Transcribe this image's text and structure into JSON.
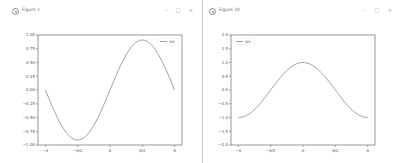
{
  "windows": [
    {
      "title": "Figure 1",
      "controls": {
        "minimize": "–",
        "maximize": "□",
        "close": "×"
      }
    },
    {
      "title": "Figure 10",
      "controls": {
        "minimize": "–",
        "maximize": "□",
        "close": "×"
      }
    }
  ],
  "colors": {
    "line": "#888888",
    "axes": "#555555",
    "background": "#ffffff"
  },
  "chart_data": [
    {
      "type": "line",
      "title": "",
      "xlabel": "",
      "ylabel": "",
      "x_tick_labels": [
        "−π",
        "−π/2",
        "0",
        "π/2",
        "π"
      ],
      "x_ticks": [
        -3.1416,
        -1.5708,
        0,
        1.5708,
        3.1416
      ],
      "y_tick_labels": [
        "1.00",
        "0.75",
        "0.50",
        "0.25",
        "0.00",
        "−0.25",
        "−0.50",
        "−0.75",
        "−1.00"
      ],
      "xlim": [
        -3.5,
        3.5
      ],
      "ylim": [
        -1.1,
        1.1
      ],
      "legend": {
        "entries": [
          "sin"
        ],
        "position": "upper right"
      },
      "series": [
        {
          "name": "sin",
          "x": [
            -3.1416,
            -2.3562,
            -1.5708,
            -0.7854,
            0,
            0.7854,
            1.5708,
            2.3562,
            3.1416
          ],
          "values": [
            0,
            -0.707,
            -1,
            -0.707,
            0,
            0.707,
            1,
            0.707,
            0
          ]
        }
      ],
      "grid": false
    },
    {
      "type": "line",
      "title": "",
      "xlabel": "",
      "ylabel": "",
      "x_tick_labels": [
        "−π",
        "−π/2",
        "0",
        "π/2",
        "π"
      ],
      "x_ticks": [
        -3.1416,
        -1.5708,
        0,
        1.5708,
        3.1416
      ],
      "y_tick_labels": [
        "2.0",
        "1.5",
        "1.0",
        "0.5",
        "0.0",
        "−0.5",
        "−1.0",
        "−1.5",
        "−2.0"
      ],
      "xlim": [
        -3.5,
        3.5
      ],
      "ylim": [
        -2,
        2
      ],
      "legend": {
        "entries": [
          "sin"
        ],
        "position": "upper left"
      },
      "series": [
        {
          "name": "sin",
          "x": [
            -3.1416,
            -2.3562,
            -1.5708,
            -0.7854,
            0,
            0.7854,
            1.5708,
            2.3562,
            3.1416
          ],
          "values": [
            -1,
            -0.707,
            0,
            0.707,
            1,
            0.707,
            0,
            -0.707,
            -1
          ]
        }
      ],
      "grid": false
    }
  ]
}
